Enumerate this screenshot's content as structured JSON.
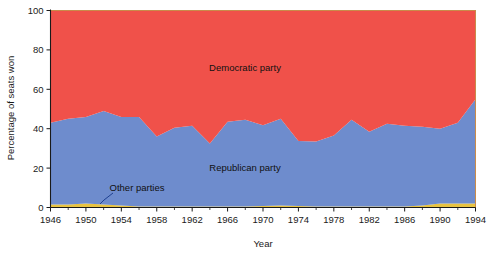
{
  "chart_data": {
    "type": "area",
    "title": "",
    "subtitle": "",
    "xlabel": "Year",
    "ylabel": "Percentage of seats won",
    "xlim": [
      1946,
      1994
    ],
    "ylim": [
      0,
      100
    ],
    "grid": false,
    "stacked": true,
    "legend_position": "inline-annotations",
    "x": [
      1946,
      1948,
      1950,
      1952,
      1954,
      1956,
      1958,
      1960,
      1962,
      1964,
      1966,
      1968,
      1970,
      1972,
      1974,
      1976,
      1978,
      1980,
      1982,
      1984,
      1986,
      1988,
      1990,
      1992,
      1994
    ],
    "xtick_labels": [
      "1946",
      "1950",
      "1954",
      "1958",
      "1962",
      "1966",
      "1970",
      "1974",
      "1978",
      "1982",
      "1986",
      "1990",
      "1994"
    ],
    "xticks": [
      1946,
      1950,
      1954,
      1958,
      1962,
      1966,
      1970,
      1974,
      1978,
      1982,
      1986,
      1990,
      1994
    ],
    "ytick_labels": [
      "0",
      "20",
      "40",
      "60",
      "80",
      "100"
    ],
    "yticks": [
      0,
      20,
      40,
      60,
      80,
      100
    ],
    "series": [
      {
        "name": "Other parties",
        "color": "#e8c341",
        "label": "Other parties",
        "values": [
          1.5,
          1.5,
          2.0,
          1.5,
          1.0,
          0.5,
          0.5,
          0.5,
          0.5,
          0.5,
          0.5,
          0.5,
          0.8,
          1.0,
          0.8,
          0.5,
          0.5,
          0.5,
          0.5,
          0.5,
          0.5,
          1.0,
          2.0,
          2.0,
          2.0
        ]
      },
      {
        "name": "Republican party",
        "color": "#6e8ccd",
        "label": "Republican party",
        "values": [
          41.5,
          43.5,
          44.0,
          47.5,
          45.0,
          45.5,
          35.5,
          40.0,
          41.0,
          32.0,
          43.0,
          44.0,
          41.0,
          44.0,
          33.0,
          33.0,
          36.0,
          44.0,
          38.0,
          42.0,
          41.0,
          40.0,
          38.0,
          41.0,
          53.0
        ]
      },
      {
        "name": "Democratic party",
        "color": "#f0514a",
        "label": "Democratic party",
        "values": [
          57.0,
          55.0,
          54.0,
          51.0,
          54.0,
          54.0,
          64.0,
          59.5,
          58.5,
          67.5,
          56.5,
          55.5,
          58.2,
          55.0,
          66.2,
          66.5,
          63.5,
          55.5,
          61.5,
          57.5,
          58.5,
          59.0,
          60.0,
          57.0,
          45.0
        ]
      }
    ],
    "annotations": [
      {
        "text": "Democratic party",
        "x_px": 245,
        "y_px": 68,
        "kind": "series-inline-label"
      },
      {
        "text": "Republican party",
        "x_px": 245,
        "y_px": 168,
        "kind": "series-inline-label"
      },
      {
        "text": "Other parties",
        "x_px": 137,
        "y_px": 188,
        "kind": "callout-label",
        "leader": true
      }
    ]
  }
}
